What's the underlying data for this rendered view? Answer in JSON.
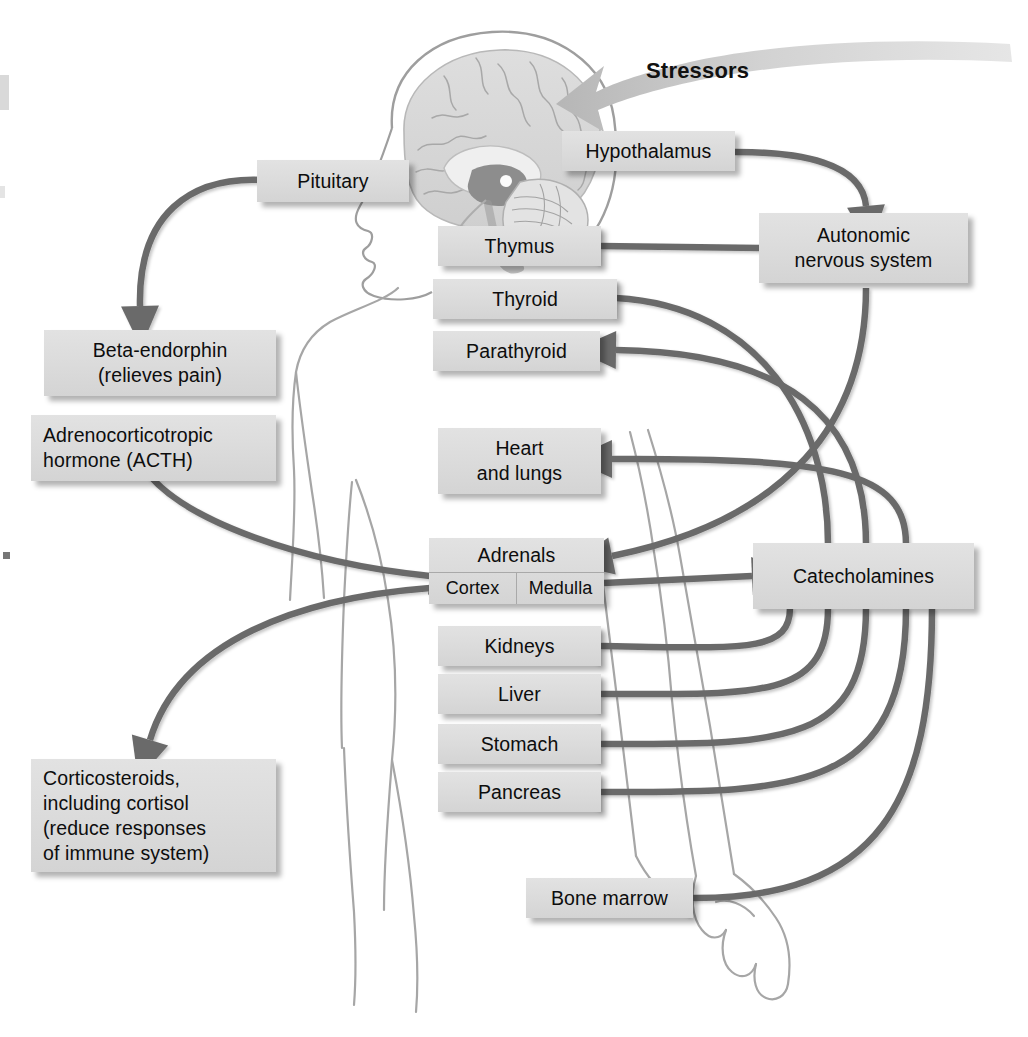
{
  "figure": {
    "type": "flow-diagram",
    "background_illustration": "sagittal-brain-in-head-and-body-outline"
  },
  "labels": {
    "stressors": "Stressors"
  },
  "nodes": [
    {
      "id": "hypothalamus",
      "label": "Hypothalamus"
    },
    {
      "id": "pituitary",
      "label": "Pituitary"
    },
    {
      "id": "autonomic",
      "label": "Autonomic\nnervous system"
    },
    {
      "id": "beta_endorphin",
      "label": "Beta-endorphin\n(relieves pain)"
    },
    {
      "id": "acth",
      "label": "Adrenocorticotropic\nhormone (ACTH)"
    },
    {
      "id": "corticosteroids",
      "label": "Corticosteroids,\nincluding cortisol\n(reduce responses\nof immune system)"
    },
    {
      "id": "thymus",
      "label": "Thymus"
    },
    {
      "id": "thyroid",
      "label": "Thyroid"
    },
    {
      "id": "parathyroid",
      "label": "Parathyroid"
    },
    {
      "id": "heart_lungs",
      "label": "Heart\nand lungs"
    },
    {
      "id": "adrenals",
      "label": "Adrenals"
    },
    {
      "id": "cortex",
      "label": "Cortex"
    },
    {
      "id": "medulla",
      "label": "Medulla"
    },
    {
      "id": "kidneys",
      "label": "Kidneys"
    },
    {
      "id": "liver",
      "label": "Liver"
    },
    {
      "id": "stomach",
      "label": "Stomach"
    },
    {
      "id": "pancreas",
      "label": "Pancreas"
    },
    {
      "id": "catecholamines",
      "label": "Catecholamines"
    },
    {
      "id": "bone_marrow",
      "label": "Bone marrow"
    }
  ],
  "edges": [
    {
      "from": "stressors",
      "to": "hypothalamus",
      "style": "broad-tapered-arrow"
    },
    {
      "from": "hypothalamus",
      "to": "autonomic",
      "style": "curved-arrow"
    },
    {
      "from": "pituitary",
      "to": "beta_endorphin",
      "style": "curved-arrow"
    },
    {
      "from": "acth",
      "to": "cortex",
      "style": "curved-arrow"
    },
    {
      "from": "cortex",
      "to": "corticosteroids",
      "style": "curved-arrow"
    },
    {
      "from": "medulla",
      "to": "catecholamines",
      "style": "straight-arrow"
    },
    {
      "from": "autonomic",
      "to": "thymus",
      "style": "straight-arrow"
    },
    {
      "from": "autonomic",
      "to": "adrenals",
      "style": "curved-arrow"
    },
    {
      "from": "catecholamines",
      "to": "thyroid",
      "style": "curved-arrow"
    },
    {
      "from": "catecholamines",
      "to": "parathyroid",
      "style": "curved-arrow"
    },
    {
      "from": "catecholamines",
      "to": "heart_lungs",
      "style": "curved-arrow"
    },
    {
      "from": "catecholamines",
      "to": "kidneys",
      "style": "curved-arrow"
    },
    {
      "from": "catecholamines",
      "to": "liver",
      "style": "curved-arrow"
    },
    {
      "from": "catecholamines",
      "to": "stomach",
      "style": "curved-arrow"
    },
    {
      "from": "catecholamines",
      "to": "pancreas",
      "style": "curved-arrow"
    },
    {
      "from": "catecholamines",
      "to": "bone_marrow",
      "style": "curved-arrow"
    }
  ],
  "colors": {
    "box_fill": "#dcdcdc",
    "box_text": "#0d0d0d",
    "arrow": "#6b6b6b",
    "stressor_arrow": "#c9c9c9",
    "anatomy_line": "#9a9a9a",
    "background": "#ffffff"
  }
}
